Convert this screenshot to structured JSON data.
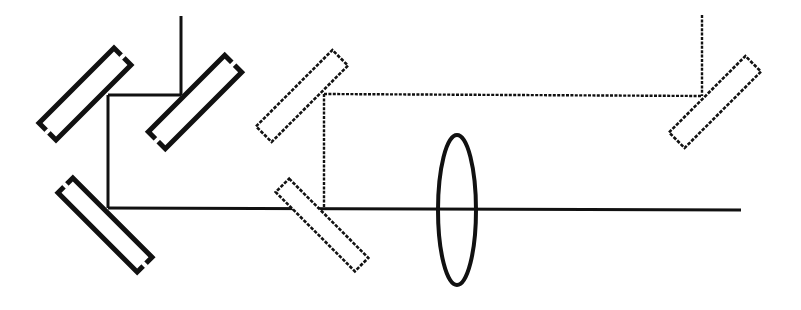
{
  "diagram": {
    "type": "optical-beam-path",
    "width": 801,
    "height": 310,
    "colors": {
      "background": "#ffffff",
      "stroke": "#111111"
    },
    "styles": {
      "solid_beam": {
        "stroke_width": 3,
        "dash": ""
      },
      "dashed_beam": {
        "stroke_width": 2.4,
        "dash": "3 1.4"
      },
      "solid_mirror": {
        "stroke_width": 5,
        "dash": ""
      },
      "dashed_mirror": {
        "stroke_width": 2.6,
        "dash": "3.5 1.5"
      },
      "lens": {
        "stroke_width": 4,
        "dash": ""
      }
    },
    "mirrors": [
      {
        "name": "mirror-bold-top-left",
        "style": "solid_mirror",
        "cx": 85,
        "cy": 94,
        "length": 106,
        "width": 24,
        "angle": -45
      },
      {
        "name": "mirror-bold-top-right",
        "style": "solid_mirror",
        "cx": 195,
        "cy": 102,
        "length": 108,
        "width": 24,
        "angle": -45
      },
      {
        "name": "mirror-bold-bottom",
        "style": "solid_mirror",
        "cx": 105,
        "cy": 225,
        "length": 112,
        "width": 21,
        "angle": 45
      },
      {
        "name": "mirror-dashed-upper",
        "style": "dashed_mirror",
        "cx": 302,
        "cy": 96,
        "length": 108,
        "width": 22,
        "angle": -45
      },
      {
        "name": "mirror-dashed-lower",
        "style": "dashed_mirror",
        "cx": 322,
        "cy": 225,
        "length": 112,
        "width": 19,
        "angle": 45
      },
      {
        "name": "mirror-dashed-far-right",
        "style": "dashed_mirror",
        "cx": 715,
        "cy": 102,
        "length": 108,
        "width": 22,
        "angle": -45
      }
    ],
    "lens": {
      "name": "converging-lens",
      "cx": 457,
      "cy": 210,
      "rx": 19,
      "ry": 75
    },
    "beams": [
      {
        "name": "beam-input-vertical-left",
        "style": "solid_beam",
        "points": [
          [
            181,
            16
          ],
          [
            181,
            95
          ]
        ]
      },
      {
        "name": "beam-top-left-horizontal",
        "style": "solid_beam",
        "points": [
          [
            108,
            95
          ],
          [
            181,
            95
          ]
        ]
      },
      {
        "name": "beam-left-vertical",
        "style": "solid_beam",
        "points": [
          [
            108,
            95
          ],
          [
            108,
            208
          ]
        ]
      },
      {
        "name": "beam-main-horizontal",
        "style": "solid_beam",
        "points": [
          [
            108,
            208
          ],
          [
            741,
            210
          ]
        ]
      },
      {
        "name": "beam-dashed-vertical",
        "style": "dashed_beam",
        "points": [
          [
            324,
            94
          ],
          [
            324,
            209
          ]
        ]
      },
      {
        "name": "beam-dashed-horizontal",
        "style": "dashed_beam",
        "points": [
          [
            324,
            94
          ],
          [
            702,
            96
          ]
        ]
      },
      {
        "name": "beam-input-vertical-right",
        "style": "dashed_beam",
        "points": [
          [
            702,
            15
          ],
          [
            702,
            96
          ]
        ]
      }
    ]
  }
}
